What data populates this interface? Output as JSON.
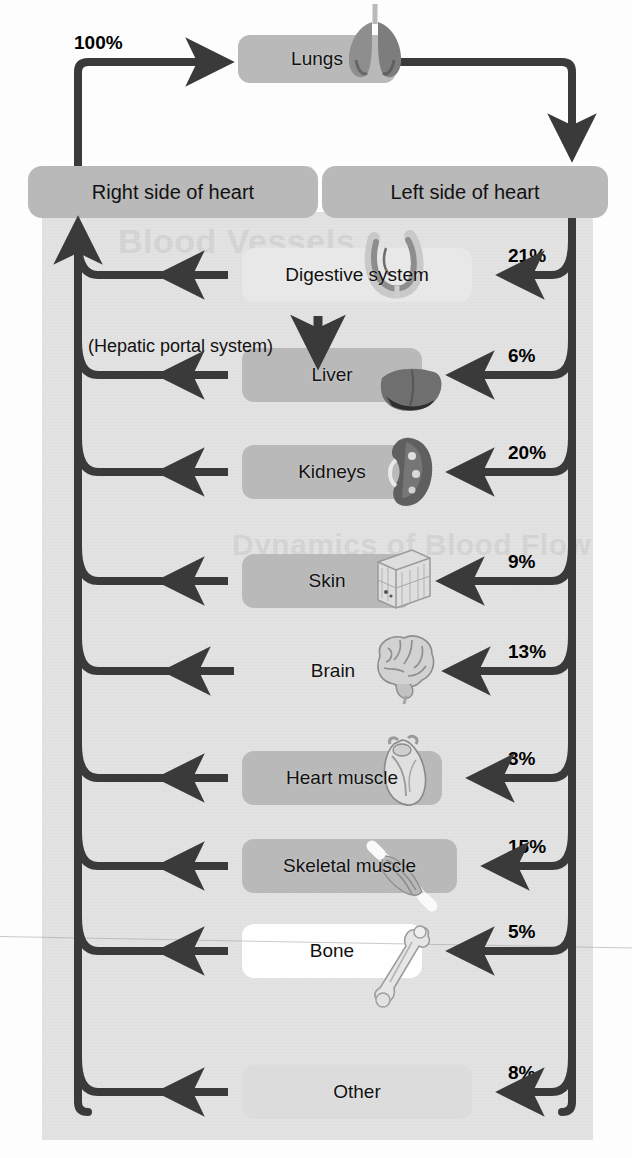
{
  "diagram": {
    "nodes": {
      "lungs": "Lungs",
      "right_heart": "Right side of heart",
      "left_heart": "Left side of heart"
    },
    "pulmonary_percent": "100%",
    "hepatic_note": "(Hepatic portal system)",
    "organs": [
      {
        "label": "Digestive system",
        "percent": "21%",
        "box": "b-soft",
        "icon": "intestine-icon"
      },
      {
        "label": "Liver",
        "percent": "6%",
        "box": "b-mid",
        "icon": "liver-icon"
      },
      {
        "label": "Kidneys",
        "percent": "20%",
        "box": "b-mid",
        "icon": "kidney-icon"
      },
      {
        "label": "Skin",
        "percent": "9%",
        "box": "b-mid",
        "icon": "skin-icon"
      },
      {
        "label": "Brain",
        "percent": "13%",
        "box": "none",
        "icon": "brain-icon"
      },
      {
        "label": "Heart muscle",
        "percent": "3%",
        "box": "b-mid",
        "icon": "heart-icon"
      },
      {
        "label": "Skeletal muscle",
        "percent": "15%",
        "box": "b-mid",
        "icon": "muscle-icon"
      },
      {
        "label": "Bone",
        "percent": "5%",
        "box": "b-white",
        "icon": "bone-icon"
      },
      {
        "label": "Other",
        "percent": "8%",
        "box": "b-faint",
        "icon": "none"
      }
    ],
    "bleed_text": [
      "Dynamics of Blood Flow",
      "Blood Vessels",
      "Blood Vessels"
    ],
    "colors": {
      "arrow": "#3a3a3a",
      "box_mid": "#b9b9b9",
      "panel": "#e3e3e3",
      "text": "#111111"
    }
  },
  "chart_data": {
    "type": "bar",
    "categories": [
      "Digestive system",
      "Liver",
      "Kidneys",
      "Skin",
      "Brain",
      "Heart muscle",
      "Skeletal muscle",
      "Bone",
      "Other"
    ],
    "values": [
      21,
      6,
      20,
      9,
      13,
      3,
      15,
      5,
      8
    ],
    "xlabel": "Body region",
    "ylabel": "Percent of cardiac output",
    "ylim": [
      0,
      25
    ],
    "total": 100,
    "legend": [
      "Percent of systemic blood flow"
    ],
    "annotations": [
      "100% of blood flows through the lungs"
    ]
  }
}
